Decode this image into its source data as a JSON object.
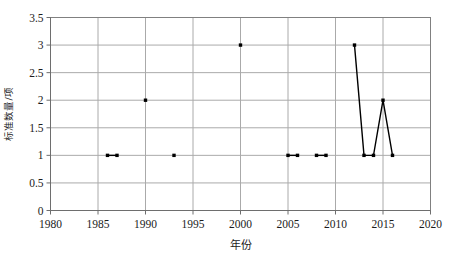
{
  "chart_data": {
    "type": "line",
    "title": "",
    "xlabel": "年份",
    "ylabel": "标准数量/项",
    "xlim": [
      1980,
      2020
    ],
    "ylim": [
      0,
      3.5
    ],
    "xticks": [
      1980,
      1985,
      1990,
      1995,
      2000,
      2005,
      2010,
      2015,
      2020
    ],
    "xtick_labels": [
      "1980",
      "1985",
      "1990",
      "1995",
      "2000",
      "2005",
      "2010",
      "2015",
      "2020"
    ],
    "yticks": [
      0,
      0.5,
      1,
      1.5,
      2,
      2.5,
      3,
      3.5
    ],
    "ytick_labels": [
      "0",
      "0.5",
      "1",
      "1.5",
      "2",
      "2.5",
      "3",
      "3.5"
    ],
    "grid": true,
    "grid_axes": "both",
    "legend": false,
    "marker": "filled-square",
    "line_color": "#000000",
    "marker_color": "#000000",
    "grid_color": "#aaaaaa",
    "axis_color": "#808080",
    "background": "#ffffff",
    "series": [
      {
        "name": "标准数量",
        "x": [
          1986,
          1987,
          1990,
          1993,
          2000,
          2005,
          2006,
          2008,
          2009,
          2012,
          2013,
          2014,
          2015,
          2016
        ],
        "values": [
          1,
          1,
          2,
          1,
          3,
          1,
          1,
          1,
          1,
          3,
          1,
          1,
          2,
          1
        ]
      }
    ],
    "segments": [
      {
        "x": [
          1986,
          1987
        ],
        "y": [
          1,
          1
        ]
      },
      {
        "x": [
          1990
        ],
        "y": [
          2
        ]
      },
      {
        "x": [
          1993
        ],
        "y": [
          1
        ]
      },
      {
        "x": [
          2000
        ],
        "y": [
          3
        ]
      },
      {
        "x": [
          2005,
          2006
        ],
        "y": [
          1,
          1
        ]
      },
      {
        "x": [
          2008,
          2009
        ],
        "y": [
          1,
          1
        ]
      },
      {
        "x": [
          2012,
          2013,
          2014,
          2015,
          2016
        ],
        "y": [
          3,
          1,
          1,
          2,
          1
        ]
      }
    ]
  }
}
